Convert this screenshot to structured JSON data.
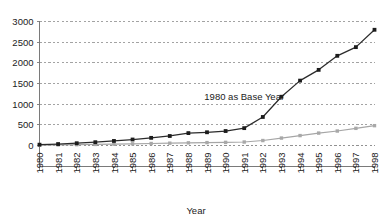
{
  "chart_data": {
    "type": "line",
    "title": "",
    "xlabel": "Year",
    "ylabel": "",
    "categories": [
      "1980",
      "1981",
      "1982",
      "1983",
      "1984",
      "1985",
      "1986",
      "1987",
      "1988",
      "1989",
      "1990",
      "1991",
      "1992",
      "1993",
      "1994",
      "1995",
      "1996",
      "1997",
      "1998"
    ],
    "ylim": [
      0,
      3000
    ],
    "yticks": [
      0,
      500,
      1000,
      1500,
      2000,
      2500,
      3000
    ],
    "ytick_labels": [
      "0",
      "500",
      "1000",
      "1500",
      "2000",
      "2500",
      "3000"
    ],
    "grid": true,
    "legend": "none",
    "annotations": [
      {
        "text": "1980 as Base Year",
        "x_category": "1991",
        "y_value": 1100
      }
    ],
    "series": [
      {
        "name": "primary-index",
        "color": "#1c1c1c",
        "marker": "square",
        "values": [
          20,
          35,
          55,
          80,
          110,
          145,
          185,
          230,
          300,
          320,
          350,
          420,
          690,
          1180,
          1570,
          1830,
          2170,
          2380,
          2800
        ]
      },
      {
        "name": "secondary-index",
        "color": "#a8a8a8",
        "marker": "square",
        "values": [
          10,
          14,
          20,
          26,
          33,
          40,
          48,
          56,
          64,
          70,
          76,
          84,
          120,
          180,
          240,
          300,
          350,
          415,
          480
        ]
      }
    ]
  },
  "axes": {
    "y_axis_name": "value-axis",
    "x_axis_name": "year-axis",
    "x_title": "Year"
  }
}
